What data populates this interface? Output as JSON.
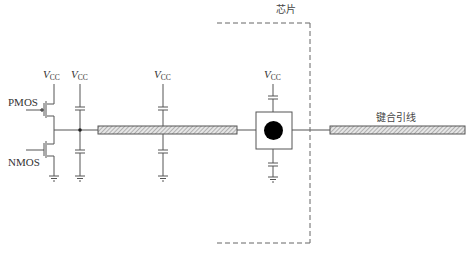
{
  "diagram": {
    "title": "",
    "chip_label": "芯片",
    "bond_wire_label": "键合引线",
    "pmos_label": "PMOS",
    "nmos_label": "NMOS",
    "supply_labels": [
      {
        "main": "V",
        "sub": "CC"
      },
      {
        "main": "V",
        "sub": "CC"
      },
      {
        "main": "V",
        "sub": "CC"
      },
      {
        "main": "V",
        "sub": "CC"
      }
    ],
    "components": [
      "PMOS transistor",
      "NMOS transistor",
      "decoupling capacitor to VCC (x4)",
      "decoupling capacitor to ground (x4)",
      "hatched on-board trace",
      "bond pad with black contact",
      "dashed chip boundary",
      "hatched bond wire"
    ],
    "colors": {
      "line": "#555555",
      "hatch": "#888888",
      "pad_contact": "#000000",
      "dashed_boundary": "#666666"
    }
  }
}
